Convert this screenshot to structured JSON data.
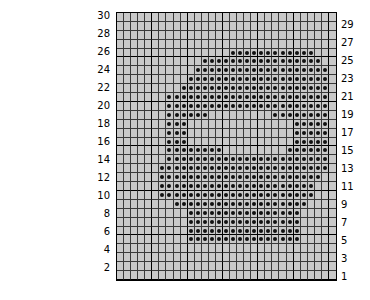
{
  "chart_data": {
    "type": "heatmap",
    "title": "",
    "subtitle": "",
    "xlabel": "",
    "ylabel": "",
    "grid": true,
    "legend": "none",
    "columns": 31,
    "rows": 30,
    "cell_colors": {
      "background": "#c9c9c9",
      "dot": "#111111",
      "gridline": "#3a3a3a",
      "major_gridline": "#000000",
      "border": "#000000"
    },
    "left_axis": {
      "position": "left",
      "tick_labels": [
        "30",
        "28",
        "26",
        "24",
        "22",
        "20",
        "18",
        "16",
        "14",
        "12",
        "10",
        "8",
        "6",
        "4",
        "2"
      ],
      "tick_rows": [
        30,
        28,
        26,
        24,
        22,
        20,
        18,
        16,
        14,
        12,
        10,
        8,
        6,
        4,
        2
      ]
    },
    "right_axis": {
      "position": "right",
      "tick_labels": [
        "29",
        "27",
        "25",
        "23",
        "21",
        "19",
        "17",
        "15",
        "13",
        "11",
        "9",
        "7",
        "5",
        "3",
        "1"
      ],
      "tick_rows": [
        29,
        27,
        25,
        23,
        21,
        19,
        17,
        15,
        13,
        11,
        9,
        7,
        5,
        3,
        1
      ]
    },
    "row_order": "top_to_bottom_30_to_1",
    "filled_cells_by_row": {
      "30": [],
      "29": [],
      "28": [],
      "27": [],
      "26": [
        17,
        18,
        19,
        20,
        21,
        22,
        23,
        24,
        25,
        26,
        27,
        28
      ],
      "25": [
        13,
        14,
        15,
        16,
        17,
        18,
        19,
        20,
        21,
        22,
        23,
        24,
        25,
        26,
        27,
        28,
        29
      ],
      "24": [
        12,
        13,
        14,
        15,
        16,
        17,
        18,
        19,
        20,
        21,
        22,
        23,
        24,
        25,
        26,
        27,
        28,
        29,
        30
      ],
      "23": [
        11,
        12,
        13,
        14,
        15,
        16,
        17,
        18,
        19,
        20,
        21,
        22,
        23,
        24,
        25,
        26,
        27,
        28,
        29,
        30
      ],
      "22": [
        10,
        11,
        12,
        13,
        14,
        15,
        16,
        17,
        18,
        19,
        20,
        21,
        22,
        23,
        24,
        25,
        26,
        27,
        28,
        29,
        30
      ],
      "21": [
        8,
        9,
        10,
        11,
        12,
        13,
        14,
        15,
        16,
        17,
        18,
        19,
        20,
        21,
        22,
        23,
        24,
        25,
        26,
        27,
        28,
        29,
        30
      ],
      "20": [
        8,
        9,
        10,
        11,
        12,
        13,
        14,
        15,
        16,
        17,
        18,
        19,
        20,
        21,
        22,
        23,
        24,
        25,
        26,
        27,
        28,
        29,
        30
      ],
      "19": [
        8,
        9,
        10,
        11,
        12,
        13,
        23,
        24,
        25,
        26,
        27,
        28,
        29,
        30
      ],
      "18": [
        8,
        9,
        10,
        26,
        27,
        28,
        29,
        30
      ],
      "17": [
        8,
        9,
        10,
        26,
        27,
        28,
        29,
        30
      ],
      "16": [
        8,
        9,
        10,
        26,
        27,
        28,
        29,
        30
      ],
      "15": [
        8,
        9,
        10,
        11,
        12,
        13,
        14,
        15,
        25,
        26,
        27,
        28,
        29,
        30
      ],
      "14": [
        8,
        9,
        10,
        11,
        12,
        13,
        14,
        15,
        16,
        17,
        18,
        19,
        20,
        21,
        22,
        23,
        24,
        25,
        26,
        27,
        28,
        29,
        30
      ],
      "13": [
        7,
        8,
        9,
        10,
        11,
        12,
        13,
        14,
        15,
        16,
        17,
        18,
        19,
        20,
        21,
        22,
        23,
        24,
        25,
        26,
        27,
        28,
        29,
        30
      ],
      "12": [
        7,
        8,
        9,
        10,
        11,
        12,
        13,
        14,
        15,
        16,
        17,
        18,
        19,
        20,
        21,
        22,
        23,
        24,
        25,
        26,
        27,
        28,
        29
      ],
      "11": [
        7,
        8,
        9,
        10,
        11,
        12,
        13,
        14,
        15,
        16,
        17,
        18,
        19,
        20,
        21,
        22,
        23,
        24,
        25,
        26,
        27,
        28
      ],
      "10": [
        7,
        8,
        9,
        10,
        11,
        12,
        13,
        14,
        15,
        16,
        17,
        18,
        19,
        20,
        21,
        22,
        23,
        24,
        25,
        26,
        27,
        28
      ],
      "9": [
        9,
        10,
        11,
        12,
        13,
        14,
        15,
        16,
        17,
        18,
        19,
        20,
        21,
        22,
        23,
        24,
        25,
        26,
        27
      ],
      "8": [
        11,
        12,
        13,
        14,
        15,
        16,
        17,
        18,
        19,
        20,
        21,
        22,
        23,
        24,
        25,
        26
      ],
      "7": [
        11,
        12,
        13,
        14,
        15,
        16,
        17,
        18,
        19,
        20,
        21,
        22,
        23,
        24,
        25,
        26
      ],
      "6": [
        11,
        12,
        13,
        14,
        15,
        16,
        17,
        18,
        19,
        20,
        21,
        22,
        23,
        24,
        25,
        26
      ],
      "5": [
        11,
        12,
        13,
        14,
        15,
        16,
        17,
        18,
        19,
        20,
        21,
        22,
        23,
        24,
        25,
        26
      ],
      "4": [],
      "3": [],
      "2": [],
      "1": []
    }
  }
}
